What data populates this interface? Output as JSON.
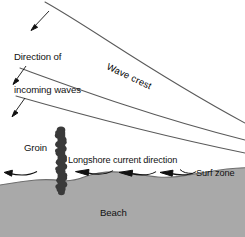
{
  "diagram": {
    "type": "coastal-process-schematic",
    "background_color": "#ffffff",
    "beach_fill_color": "#a9a9a9",
    "beach_edge_color": "#707070",
    "wave_line_color": "#5a5a5a",
    "groin_color": "#3a3a3a",
    "arrow_color": "#111111",
    "text_color": "#111111",
    "labels": {
      "direction_line1": "Direction of",
      "direction_line2": "incoming waves",
      "wave_crest": "Wave crest",
      "groin": "Groin",
      "longshore_current": "Longshore current direction",
      "surf_zone": "Surf zone",
      "beach": "Beach"
    },
    "features": {
      "wave_crest_count": 3,
      "incoming_wave_arrow_count": 3,
      "longshore_arrow_count": 4,
      "groin_block_count": 22
    },
    "wave_crests": [
      {
        "name": "crest-1",
        "path": "M 45 2 C 95 30 150 72 245 123"
      },
      {
        "name": "crest-2",
        "path": "M 20 68 C 75 88 150 116 245 140"
      },
      {
        "name": "crest-3",
        "path": "M 16 96 C 72 112 152 134 245 153"
      }
    ],
    "incoming_wave_arrows": [
      {
        "name": "incoming-arrow-1",
        "x1": 49,
        "y1": 11,
        "x2": 31,
        "y2": 30
      },
      {
        "name": "incoming-arrow-2",
        "x1": 26,
        "y1": 66,
        "x2": 13,
        "y2": 84
      },
      {
        "name": "incoming-arrow-3",
        "x1": 25,
        "y1": 98,
        "x2": 12,
        "y2": 117
      }
    ],
    "longshore_arrows": [
      {
        "name": "longshore-arrow-1",
        "from_x": 37,
        "to_x": 5,
        "y": 173
      },
      {
        "name": "longshore-arrow-2",
        "from_x": 113,
        "to_x": 76,
        "y": 172
      },
      {
        "name": "longshore-arrow-3",
        "from_x": 156,
        "to_x": 119,
        "y": 173
      },
      {
        "name": "longshore-arrow-4",
        "from_x": 196,
        "to_x": 160,
        "y": 173
      }
    ]
  }
}
